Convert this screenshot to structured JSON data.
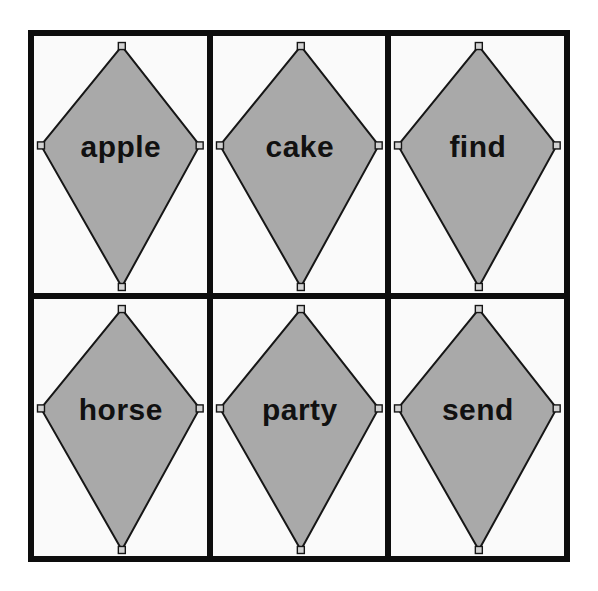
{
  "grid": {
    "rows": 2,
    "columns": 3
  },
  "colors": {
    "page_background": "#ffffff",
    "frame_border": "#0d0d0d",
    "cell_background": "#fafafa",
    "kite_fill": "#a9a9a9",
    "kite_outline": "#161616",
    "handle_fill": "#d2d2d2",
    "word_color": "#111111"
  },
  "cards": [
    {
      "word": "apple"
    },
    {
      "word": "cake"
    },
    {
      "word": "find"
    },
    {
      "word": "horse"
    },
    {
      "word": "party"
    },
    {
      "word": "send"
    }
  ]
}
